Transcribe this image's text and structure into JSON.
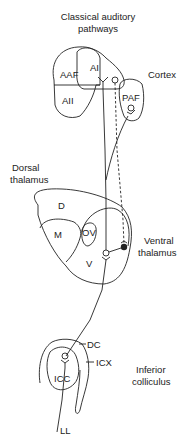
{
  "title": {
    "line1": "Classical auditory",
    "line2": "pathways"
  },
  "regions": {
    "cortex": {
      "label": "Cortex",
      "areas": {
        "aaf": "AAF",
        "ai": "AI",
        "aii": "AII",
        "paf": "PAF"
      }
    },
    "dorsal_thalamus": {
      "line1": "Dorsal",
      "line2": "thalamus",
      "areas": {
        "d": "D",
        "m": "M",
        "ov": "OV",
        "v": "V"
      }
    },
    "ventral_thalamus": {
      "line1": "Ventral",
      "line2": "thalamus"
    },
    "inferior_colliculus": {
      "line1": "Inferior",
      "line2": "colliculus",
      "areas": {
        "dc": "DC",
        "icx": "ICX",
        "icc": "ICC"
      }
    },
    "lateral_lemniscus": {
      "label": "LL"
    }
  },
  "colors": {
    "stroke": "#222222",
    "background": "#ffffff"
  }
}
